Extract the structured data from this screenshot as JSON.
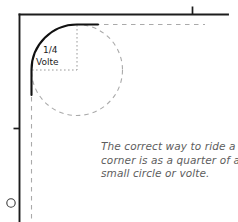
{
  "figure": {
    "label": {
      "fraction": "1/4",
      "word": "Volte"
    },
    "caption": {
      "lines": [
        "The correct way to ride a",
        "corner is as a quarter of a",
        "small circle or volte."
      ],
      "full_text": "The correct way to ride a corner is as a quarter of a small circle or volte."
    },
    "colors": {
      "arena_wall": "#1c1c1c",
      "guide_dash": "#a8a8a8",
      "caption_text": "#5d5d5d",
      "label_text": "#1a1a1a",
      "background": "#ffffff"
    },
    "elements": {
      "arena_corner_walls": "solid black lines forming the top and left arena boundary",
      "track_arc": "solid black quarter-circle arc rounding the corner",
      "volte_circle": "grey dashed full circle tangent to both walls",
      "radius_vertical": "grey dotted radius from circle centre up to arc top",
      "radius_horizontal": "grey dotted radius from circle centre left to arc side",
      "tangent_top": "grey dashed horizontal line continuing right from arc top",
      "tangent_left": "grey dashed vertical line continuing down from arc end",
      "wall_marker_top": "short black tick above the top wall",
      "wall_marker_left": "short black tick on the left wall",
      "corner_dot": "small circle outline outside the left wall near the bottom"
    }
  }
}
